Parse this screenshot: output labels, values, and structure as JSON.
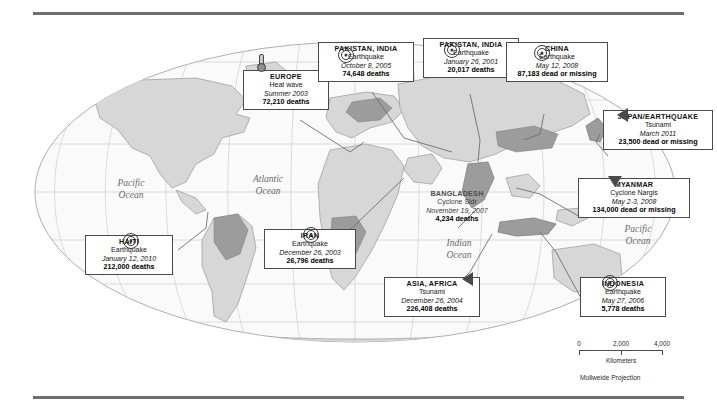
{
  "map": {
    "projection_note": "Mollweide Projection",
    "scale": {
      "ticks": [
        "0",
        "2,000",
        "4,000"
      ],
      "unit": "Kilometers"
    },
    "ocean_labels": [
      {
        "name": "pacific-ocean-west",
        "line1": "Pacific",
        "line2": "Ocean"
      },
      {
        "name": "atlantic-ocean",
        "line1": "Atlantic",
        "line2": "Ocean"
      },
      {
        "name": "indian-ocean",
        "line1": "Indian",
        "line2": "Ocean"
      },
      {
        "name": "pacific-ocean-east",
        "line1": "Pacific",
        "line2": "Ocean"
      }
    ]
  },
  "events": [
    {
      "id": "europe",
      "place": "EUROPE",
      "kind": "Heat wave",
      "date": "Summer 2003",
      "toll": "72,210 deaths",
      "symbol": "thermometer-icon",
      "boxed": true
    },
    {
      "id": "pakistan-india-2005",
      "place": "PAKISTAN, INDIA",
      "kind": "Earthquake",
      "date": "October 8, 2005",
      "toll": "74,648 deaths",
      "symbol": "earthquake-icon",
      "boxed": true
    },
    {
      "id": "pakistan-india-2001",
      "place": "PAKISTAN, INDIA",
      "kind": "Earthquake",
      "date": "January 26, 2001",
      "toll": "20,017 deaths",
      "symbol": "earthquake-icon",
      "boxed": true
    },
    {
      "id": "china",
      "place": "CHINA",
      "kind": "Earthquake",
      "date": "May 12, 2008",
      "toll": "87,183 dead or missing",
      "symbol": "earthquake-icon",
      "boxed": true
    },
    {
      "id": "japan",
      "place": "JAPAN/EARTHQUAKE",
      "kind": "Tsunami",
      "date": "March 2011",
      "toll": "23,500 dead or missing",
      "symbol": "tsunami-icon",
      "boxed": true
    },
    {
      "id": "myanmar",
      "place": "MYANMAR",
      "kind": "Cyclone Nargis",
      "date": "May 2-3, 2008",
      "toll": "134,000 dead or missing",
      "symbol": "cyclone-icon",
      "boxed": true
    },
    {
      "id": "bangladesh",
      "place": "BANGLADESH",
      "kind": "Cyclone Sidr",
      "date": "November 19, 2007",
      "toll": "4,234 deaths",
      "symbol": "cyclone-icon",
      "boxed": false
    },
    {
      "id": "indonesia",
      "place": "INDONESIA",
      "kind": "Earthquake",
      "date": "May 27, 2006",
      "toll": "5,778 deaths",
      "symbol": "earthquake-icon",
      "boxed": true
    },
    {
      "id": "asia-africa",
      "place": "ASIA, AFRICA",
      "kind": "Tsunami",
      "date": "December 26, 2004",
      "toll": "226,408 deaths",
      "symbol": "tsunami-icon",
      "boxed": true
    },
    {
      "id": "iran",
      "place": "IRAN",
      "kind": "Earthquake",
      "date": "December 26, 2003",
      "toll": "26,796 deaths",
      "symbol": "earthquake-icon",
      "boxed": true
    },
    {
      "id": "haiti",
      "place": "HAITI",
      "kind": "Earthquake",
      "date": "January 12, 2010",
      "toll": "212,000 deaths",
      "symbol": "earthquake-icon",
      "boxed": true
    }
  ],
  "colors": {
    "rule": "#6e6e6e",
    "ocean_fill": "#fafafa",
    "land_fill": "#d9d9d9",
    "land_dark": "#9e9e9e",
    "graticule": "#c8c8c8",
    "box_border": "#4a4a4a"
  }
}
